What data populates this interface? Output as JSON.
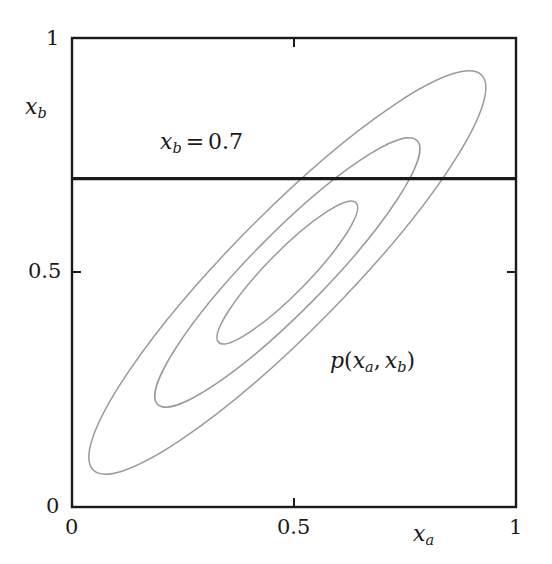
{
  "figure": {
    "kind": "contour-plot",
    "background_color": "#ffffff",
    "axis_color": "#1a1a1a",
    "contour_color": "#9a9a9a",
    "conditioning_line_color": "#1a1a1a"
  },
  "axes": {
    "x": {
      "name_parts": {
        "base": "x",
        "sub": "a"
      },
      "name_plain": "x_a",
      "ticks": [
        {
          "value": 0,
          "label": "0"
        },
        {
          "value": 0.5,
          "label": "0.5"
        },
        {
          "value": 1,
          "label": "1"
        }
      ],
      "range": [
        0,
        1
      ]
    },
    "y": {
      "name_parts": {
        "base": "x",
        "sub": "b"
      },
      "name_plain": "x_b",
      "ticks": [
        {
          "value": 0,
          "label": "0"
        },
        {
          "value": 0.5,
          "label": "0.5"
        },
        {
          "value": 1,
          "label": "1"
        }
      ],
      "range": [
        0,
        1
      ]
    }
  },
  "annotations": {
    "conditioning_label": {
      "base": "x",
      "sub": "b",
      "operator": "=",
      "value": "0.7",
      "plain": "x_b = 0.7"
    },
    "density_label": {
      "fn": "p",
      "open": "(",
      "arg1_base": "x",
      "arg1_sub": "a",
      "comma": ",",
      "arg2_base": "x",
      "arg2_sub": "b",
      "close": ")",
      "plain": "p(x_a, x_b)"
    }
  },
  "chart_data": {
    "type": "line",
    "title": "",
    "xlabel": "x_a",
    "ylabel": "x_b",
    "xlim": [
      0,
      1
    ],
    "ylim": [
      0,
      1
    ],
    "grid": false,
    "legend": "none",
    "xticks": [
      0,
      0.5,
      1
    ],
    "xticklabels": [
      "0",
      "0.5",
      "1"
    ],
    "yticks": [
      0,
      0.5,
      1
    ],
    "yticklabels": [
      "0",
      "0.5",
      "1"
    ],
    "gaussian": {
      "mean": [
        0.485,
        0.5
      ],
      "correlation": 0.96,
      "sigma_a": 0.155,
      "sigma_b": 0.165,
      "major_axis_angle_deg": 45.5
    },
    "contours": [
      {
        "name": "outer-contour",
        "level": 3,
        "center": [
          0.485,
          0.5
        ],
        "semi_major_px": 277,
        "semi_minor_px": 58,
        "rotation_deg": -45.5,
        "tip_low": [
          0.063,
          0.079
        ],
        "tip_high": [
          0.93,
          0.915
        ]
      },
      {
        "name": "middle-contour",
        "level": 2,
        "center": [
          0.485,
          0.5
        ],
        "semi_major_px": 185,
        "semi_minor_px": 38,
        "rotation_deg": -45.5,
        "tip_low": [
          0.216,
          0.219
        ],
        "tip_high": [
          0.779,
          0.778
        ]
      },
      {
        "name": "inner-contour",
        "level": 1,
        "center": [
          0.485,
          0.5
        ],
        "semi_major_px": 98,
        "semi_minor_px": 21,
        "rotation_deg": -45.5,
        "tip_low": [
          0.33,
          0.356
        ],
        "tip_high": [
          0.64,
          0.64
        ]
      }
    ],
    "conditioning_line": {
      "orientation": "horizontal",
      "y_value": 0.7,
      "x_from": 0,
      "x_to": 1,
      "label": "x_b = 0.7"
    }
  }
}
